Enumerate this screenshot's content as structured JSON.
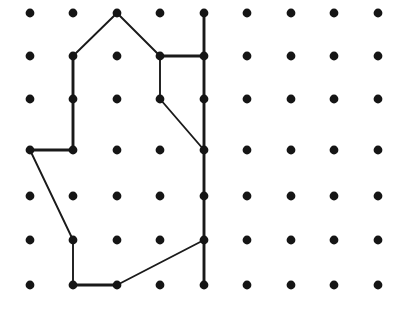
{
  "board": {
    "title": "Geoboard dot grid with rubber-band polygon",
    "width": 413,
    "height": 314,
    "background_color": "#ffffff",
    "columns": 9,
    "rows": 7,
    "column_x": [
      30,
      73,
      117,
      160,
      204,
      247,
      291,
      334,
      378
    ],
    "row_y": [
      13,
      56,
      99,
      150,
      196,
      240,
      285
    ],
    "peg": {
      "label": "peg",
      "radius": 4.4,
      "color": "#151515",
      "count": 63
    },
    "band": {
      "label": "rubber band",
      "color": "#1a1a1a",
      "stroke_width": 1.9,
      "thick_stroke_width": 2.9
    }
  },
  "figure": {
    "name": "closed-polygon-with-inner-branch",
    "outline_points_grid": [
      [
        3,
        1
      ],
      [
        2,
        2
      ],
      [
        2,
        4
      ],
      [
        1,
        4
      ],
      [
        2,
        6
      ],
      [
        2,
        7
      ],
      [
        3,
        7
      ],
      [
        5,
        6
      ],
      [
        5,
        1
      ]
    ],
    "segments": [
      {
        "name": "apex-to-upper-left",
        "from": [
          117,
          13
        ],
        "to": [
          73,
          56
        ],
        "weight": "thin"
      },
      {
        "name": "apex-to-upper-right",
        "from": [
          117,
          13
        ],
        "to": [
          160,
          56
        ],
        "weight": "thin"
      },
      {
        "name": "left-upper-vertical",
        "from": [
          73,
          56
        ],
        "to": [
          73,
          150
        ],
        "weight": "thick"
      },
      {
        "name": "left-horizontal",
        "from": [
          73,
          150
        ],
        "to": [
          30,
          150
        ],
        "weight": "thick"
      },
      {
        "name": "left-lower-diagonal",
        "from": [
          30,
          150
        ],
        "to": [
          73,
          240
        ],
        "weight": "thin"
      },
      {
        "name": "left-lower-vertical",
        "from": [
          73,
          240
        ],
        "to": [
          73,
          285
        ],
        "weight": "thin"
      },
      {
        "name": "bottom-horizontal",
        "from": [
          73,
          285
        ],
        "to": [
          117,
          285
        ],
        "weight": "thick"
      },
      {
        "name": "bottom-diagonal",
        "from": [
          117,
          285
        ],
        "to": [
          204,
          240
        ],
        "weight": "thin"
      },
      {
        "name": "right-vertical",
        "from": [
          204,
          13
        ],
        "to": [
          204,
          285
        ],
        "weight": "thick"
      },
      {
        "name": "inner-top-horizontal",
        "from": [
          160,
          56
        ],
        "to": [
          204,
          56
        ],
        "weight": "thick"
      },
      {
        "name": "inner-vertical",
        "from": [
          160,
          56
        ],
        "to": [
          160,
          99
        ],
        "weight": "thin"
      },
      {
        "name": "inner-diagonal",
        "from": [
          160,
          99
        ],
        "to": [
          204,
          150
        ],
        "weight": "thin"
      }
    ],
    "vertex_points": [
      [
        117,
        13
      ],
      [
        204,
        13
      ],
      [
        73,
        56
      ],
      [
        160,
        56
      ],
      [
        204,
        56
      ],
      [
        73,
        99
      ],
      [
        160,
        99
      ],
      [
        204,
        99
      ],
      [
        30,
        150
      ],
      [
        73,
        150
      ],
      [
        204,
        150
      ],
      [
        204,
        196
      ],
      [
        73,
        240
      ],
      [
        204,
        240
      ],
      [
        73,
        285
      ],
      [
        117,
        285
      ],
      [
        204,
        285
      ]
    ]
  }
}
